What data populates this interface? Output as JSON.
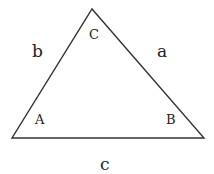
{
  "diagram": {
    "type": "triangle",
    "stroke_color": "#333333",
    "background": "#ffffff",
    "vertices": [
      {
        "label": "A",
        "x": 12,
        "y": 138
      },
      {
        "label": "B",
        "x": 204,
        "y": 138
      },
      {
        "label": "C",
        "x": 92,
        "y": 9
      }
    ],
    "vertex_labels": {
      "A": "A",
      "B": "B",
      "C": "C"
    },
    "side_labels": {
      "a": "a",
      "b": "b",
      "c": "c"
    }
  }
}
